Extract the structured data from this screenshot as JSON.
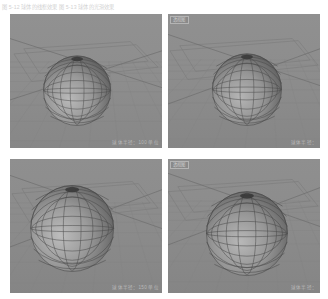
{
  "caption": {
    "text": "图 5-12  球体的线框效果   图 5-13  球体的光滑效果"
  },
  "colors": {
    "viewport_background": "#8e8e8e",
    "panel_border": "#ffffff",
    "grid_line": "#7e7e7e",
    "axis_line": "#6f6f6f",
    "sphere_fill": "#8b8b8b",
    "sphere_wire": "#4e4e4e",
    "hud_text": "#b9b9b9",
    "caption_text": "#d2d2d2",
    "page_background": "#ffffff"
  },
  "viewports": [
    {
      "id": "viewport-top-left",
      "label": "",
      "show_label": false,
      "hud": "球体半径：100 单位",
      "sphere": {
        "center_x_pct": 44,
        "center_y_pct": 57,
        "radius_pct": 26,
        "segments": 16,
        "rings": 9,
        "shading": "wireframe"
      },
      "camera": "透视图"
    },
    {
      "id": "viewport-top-right",
      "label": "透视图",
      "show_label": true,
      "hud": "球体半径：",
      "sphere": {
        "center_x_pct": 52,
        "center_y_pct": 56,
        "radius_pct": 27,
        "segments": 16,
        "rings": 9,
        "shading": "wireframe"
      },
      "camera": "透视图"
    },
    {
      "id": "viewport-bottom-left",
      "label": "",
      "show_label": false,
      "hud": "球体半径：150 单位",
      "sphere": {
        "center_x_pct": 41,
        "center_y_pct": 52,
        "radius_pct": 32,
        "segments": 16,
        "rings": 9,
        "shading": "wireframe"
      },
      "camera": "透视图"
    },
    {
      "id": "viewport-bottom-right",
      "label": "透视图",
      "show_label": true,
      "hud": "球体半径：",
      "sphere": {
        "center_x_pct": 52,
        "center_y_pct": 56,
        "radius_pct": 31,
        "segments": 16,
        "rings": 9,
        "shading": "wireframe"
      },
      "camera": "透视图"
    }
  ]
}
